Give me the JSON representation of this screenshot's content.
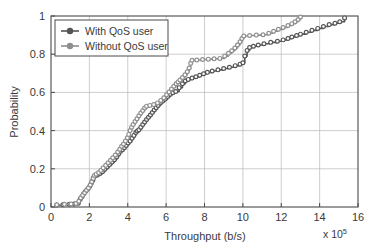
{
  "figure": {
    "background": "#ffffff",
    "axes_color": "#4a4a4a",
    "grid_color": "#b9b9b9"
  },
  "legend": {
    "position": "top-left-inside",
    "items": [
      {
        "label": "With QoS user",
        "color": "#555555",
        "marker": "circle"
      },
      {
        "label": "Without QoS user",
        "color": "#8f8f8f",
        "marker": "circle"
      }
    ]
  },
  "chart_data": {
    "type": "line",
    "title": "",
    "subtitle": "",
    "xlabel": "Throughput (b/s)",
    "ylabel": "Probability",
    "x_multiplier": "x 10",
    "x_multiplier_exponent": "5",
    "xlim": [
      0,
      16
    ],
    "ylim": [
      0,
      1
    ],
    "xticks": [
      0,
      2,
      4,
      6,
      8,
      10,
      12,
      14,
      16
    ],
    "xticklabels": [
      "0",
      "2",
      "4",
      "6",
      "8",
      "10",
      "12",
      "14",
      "16"
    ],
    "yticks": [
      0,
      0.2,
      0.4,
      0.6,
      0.8,
      1
    ],
    "yticklabels": [
      "0",
      "0.2",
      "0.4",
      "0.6",
      "0.8",
      "1"
    ],
    "grid": true,
    "legend_position": "upper left",
    "markers": true,
    "series": [
      {
        "name": "With QoS user",
        "color": "#555555",
        "points": [
          [
            0.3,
            0.01
          ],
          [
            0.62,
            0.012
          ],
          [
            0.95,
            0.014
          ],
          [
            1.2,
            0.016
          ],
          [
            1.42,
            0.02
          ],
          [
            1.52,
            0.04
          ],
          [
            1.62,
            0.055
          ],
          [
            1.7,
            0.07
          ],
          [
            1.8,
            0.082
          ],
          [
            1.92,
            0.095
          ],
          [
            2.02,
            0.108
          ],
          [
            2.1,
            0.125
          ],
          [
            2.18,
            0.14
          ],
          [
            2.22,
            0.155
          ],
          [
            2.3,
            0.163
          ],
          [
            2.42,
            0.168
          ],
          [
            2.55,
            0.175
          ],
          [
            2.68,
            0.185
          ],
          [
            2.8,
            0.198
          ],
          [
            2.92,
            0.21
          ],
          [
            3.05,
            0.222
          ],
          [
            3.18,
            0.235
          ],
          [
            3.3,
            0.248
          ],
          [
            3.42,
            0.262
          ],
          [
            3.52,
            0.278
          ],
          [
            3.62,
            0.292
          ],
          [
            3.72,
            0.3
          ],
          [
            3.82,
            0.31
          ],
          [
            3.92,
            0.322
          ],
          [
            4.02,
            0.335
          ],
          [
            4.12,
            0.345
          ],
          [
            4.22,
            0.36
          ],
          [
            4.32,
            0.375
          ],
          [
            4.42,
            0.39
          ],
          [
            4.5,
            0.398
          ],
          [
            4.58,
            0.405
          ],
          [
            4.68,
            0.418
          ],
          [
            4.78,
            0.432
          ],
          [
            4.88,
            0.445
          ],
          [
            4.98,
            0.458
          ],
          [
            5.08,
            0.47
          ],
          [
            5.18,
            0.482
          ],
          [
            5.28,
            0.495
          ],
          [
            5.38,
            0.508
          ],
          [
            5.48,
            0.52
          ],
          [
            5.58,
            0.532
          ],
          [
            5.7,
            0.545
          ],
          [
            5.82,
            0.555
          ],
          [
            5.95,
            0.565
          ],
          [
            6.08,
            0.578
          ],
          [
            6.22,
            0.59
          ],
          [
            6.35,
            0.598
          ],
          [
            6.5,
            0.605
          ],
          [
            6.68,
            0.625
          ],
          [
            6.85,
            0.645
          ],
          [
            7.0,
            0.66
          ],
          [
            7.15,
            0.668
          ],
          [
            7.35,
            0.675
          ],
          [
            7.55,
            0.682
          ],
          [
            7.75,
            0.69
          ],
          [
            7.95,
            0.698
          ],
          [
            8.15,
            0.705
          ],
          [
            8.4,
            0.712
          ],
          [
            8.7,
            0.718
          ],
          [
            9.0,
            0.725
          ],
          [
            9.3,
            0.732
          ],
          [
            9.6,
            0.74
          ],
          [
            9.85,
            0.748
          ],
          [
            10.0,
            0.755
          ],
          [
            10.1,
            0.79
          ],
          [
            10.22,
            0.82
          ],
          [
            10.35,
            0.835
          ],
          [
            10.55,
            0.842
          ],
          [
            10.8,
            0.848
          ],
          [
            11.1,
            0.855
          ],
          [
            11.45,
            0.862
          ],
          [
            11.8,
            0.868
          ],
          [
            12.1,
            0.875
          ],
          [
            12.35,
            0.882
          ],
          [
            12.55,
            0.89
          ],
          [
            12.8,
            0.898
          ],
          [
            13.0,
            0.905
          ],
          [
            13.3,
            0.915
          ],
          [
            13.6,
            0.925
          ],
          [
            13.9,
            0.935
          ],
          [
            14.2,
            0.945
          ],
          [
            14.5,
            0.955
          ],
          [
            14.8,
            0.962
          ],
          [
            15.05,
            0.97
          ],
          [
            15.3,
            0.99
          ]
        ]
      },
      {
        "name": "Without QoS user",
        "color": "#8f8f8f",
        "points": [
          [
            0.3,
            0.012
          ],
          [
            0.7,
            0.014
          ],
          [
            1.05,
            0.016
          ],
          [
            1.3,
            0.018
          ],
          [
            1.45,
            0.03
          ],
          [
            1.55,
            0.048
          ],
          [
            1.65,
            0.062
          ],
          [
            1.75,
            0.075
          ],
          [
            1.85,
            0.088
          ],
          [
            1.95,
            0.1
          ],
          [
            2.05,
            0.115
          ],
          [
            2.12,
            0.132
          ],
          [
            2.2,
            0.15
          ],
          [
            2.26,
            0.165
          ],
          [
            2.35,
            0.172
          ],
          [
            2.48,
            0.18
          ],
          [
            2.6,
            0.192
          ],
          [
            2.72,
            0.205
          ],
          [
            2.85,
            0.218
          ],
          [
            2.98,
            0.232
          ],
          [
            3.1,
            0.245
          ],
          [
            3.22,
            0.258
          ],
          [
            3.35,
            0.272
          ],
          [
            3.48,
            0.288
          ],
          [
            3.58,
            0.302
          ],
          [
            3.68,
            0.318
          ],
          [
            3.78,
            0.33
          ],
          [
            3.88,
            0.345
          ],
          [
            3.98,
            0.362
          ],
          [
            4.05,
            0.38
          ],
          [
            4.12,
            0.4
          ],
          [
            4.2,
            0.418
          ],
          [
            4.28,
            0.432
          ],
          [
            4.38,
            0.448
          ],
          [
            4.48,
            0.462
          ],
          [
            4.58,
            0.478
          ],
          [
            4.68,
            0.492
          ],
          [
            4.78,
            0.505
          ],
          [
            4.88,
            0.518
          ],
          [
            4.98,
            0.528
          ],
          [
            5.15,
            0.532
          ],
          [
            5.35,
            0.536
          ],
          [
            5.55,
            0.545
          ],
          [
            5.72,
            0.558
          ],
          [
            5.88,
            0.572
          ],
          [
            6.02,
            0.588
          ],
          [
            6.15,
            0.602
          ],
          [
            6.28,
            0.618
          ],
          [
            6.4,
            0.632
          ],
          [
            6.52,
            0.645
          ],
          [
            6.62,
            0.655
          ],
          [
            6.72,
            0.665
          ],
          [
            6.85,
            0.678
          ],
          [
            6.98,
            0.692
          ],
          [
            7.1,
            0.708
          ],
          [
            7.2,
            0.728
          ],
          [
            7.28,
            0.752
          ],
          [
            7.35,
            0.768
          ],
          [
            7.6,
            0.77
          ],
          [
            7.9,
            0.772
          ],
          [
            8.2,
            0.774
          ],
          [
            8.5,
            0.776
          ],
          [
            8.8,
            0.778
          ],
          [
            9.05,
            0.79
          ],
          [
            9.25,
            0.805
          ],
          [
            9.42,
            0.818
          ],
          [
            9.58,
            0.832
          ],
          [
            9.72,
            0.848
          ],
          [
            9.85,
            0.865
          ],
          [
            9.95,
            0.882
          ],
          [
            10.05,
            0.895
          ],
          [
            10.35,
            0.898
          ],
          [
            10.7,
            0.9
          ],
          [
            11.05,
            0.902
          ],
          [
            11.35,
            0.91
          ],
          [
            11.6,
            0.92
          ],
          [
            11.85,
            0.93
          ],
          [
            12.1,
            0.94
          ],
          [
            12.35,
            0.95
          ],
          [
            12.55,
            0.96
          ],
          [
            12.72,
            0.97
          ],
          [
            12.88,
            0.982
          ],
          [
            13.0,
            0.995
          ]
        ]
      }
    ]
  }
}
